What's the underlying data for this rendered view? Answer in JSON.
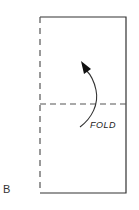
{
  "figure": {
    "panel_label": "B",
    "fold_label": "FOLD",
    "colors": {
      "line": "#333333",
      "background": "#ffffff"
    },
    "sheet": {
      "left": 40,
      "top": 17,
      "right": 126,
      "bottom": 193,
      "left_edge_style": "dashed",
      "other_edges_style": "solid"
    },
    "fold_line": {
      "y": 104,
      "style": "dashed"
    },
    "arrow": {
      "direction": "up-left",
      "shape": "curved"
    }
  }
}
